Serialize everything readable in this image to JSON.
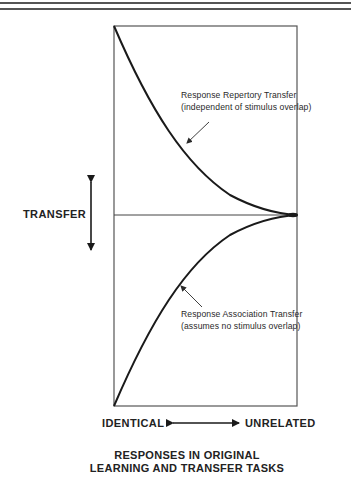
{
  "diagram": {
    "y_axis_label": "TRANSFER",
    "x_axis": {
      "left_label": "IDENTICAL",
      "right_label": "UNRELATED"
    },
    "caption": {
      "line1": "RESPONSES IN ORIGINAL",
      "line2": "LEARNING AND TRANSFER TASKS"
    },
    "curves": [
      {
        "name": "Response Repertory Transfer",
        "label_line1": "Response Repertory Transfer",
        "label_line2": "(independent of stimulus overlap)",
        "position": "upper",
        "trend": "decreases from maximum positive transfer at identical to zero at unrelated"
      },
      {
        "name": "Response Association Transfer",
        "label_line1": "Response Association Transfer",
        "label_line2": "(assumes no stimulus overlap)",
        "position": "lower",
        "trend": "increases from maximum negative transfer at identical to zero at unrelated"
      }
    ],
    "colors": {
      "line": "#1a1a1a",
      "frame": "#555555",
      "background": "#ffffff"
    }
  }
}
